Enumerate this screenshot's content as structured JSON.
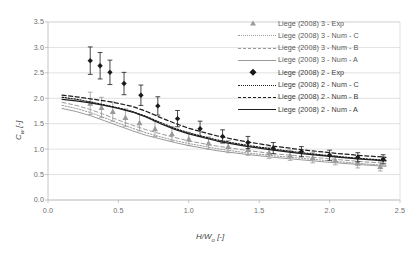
{
  "chart_data": {
    "type": "scatter",
    "title": "",
    "xlabel": "H/W_o [-]",
    "xlabel_display": "H/W",
    "xlabel_sub": "o",
    "xlabel_unit": " [-]",
    "ylabel": "C_w [-]",
    "ylabel_display": "C",
    "ylabel_sub": "w",
    "ylabel_unit": " [-]",
    "xlim": [
      0.0,
      2.5
    ],
    "ylim": [
      0.0,
      3.5
    ],
    "xticks": [
      "0.0",
      "0.5",
      "1.0",
      "1.5",
      "2.0",
      "2.5"
    ],
    "xtick_values": [
      0.0,
      0.5,
      1.0,
      1.5,
      2.0,
      2.5
    ],
    "yticks": [
      "0.0",
      "0.5",
      "1.0",
      "1.5",
      "2.0",
      "2.5",
      "3.0",
      "3.5"
    ],
    "ytick_values": [
      0.0,
      0.5,
      1.0,
      1.5,
      2.0,
      2.5,
      3.0,
      3.5
    ],
    "grid": "horizontal",
    "legend_position": "right",
    "series": [
      {
        "name": "Liege (2008) 3 - Exp",
        "type": "scatter",
        "marker": "triangle",
        "color": "#9a9a9a",
        "has_error_bars": true,
        "x": [
          0.3,
          0.38,
          0.46,
          0.55,
          0.65,
          0.76,
          0.88,
          1.0,
          1.14,
          1.28,
          1.42,
          1.57,
          1.72,
          1.88,
          2.04,
          2.2,
          2.36
        ],
        "y": [
          1.9,
          1.82,
          1.74,
          1.62,
          1.52,
          1.4,
          1.3,
          1.2,
          1.12,
          1.05,
          0.99,
          0.93,
          0.88,
          0.83,
          0.78,
          0.72,
          0.66
        ],
        "yerr": [
          0.22,
          0.2,
          0.19,
          0.17,
          0.16,
          0.15,
          0.14,
          0.13,
          0.12,
          0.12,
          0.11,
          0.11,
          0.1,
          0.1,
          0.09,
          0.09,
          0.09
        ]
      },
      {
        "name": "Liege (2008) 3 - Num - C",
        "type": "line",
        "style": "dotted",
        "color": "#9a9a9a",
        "x": [
          0.1,
          0.2,
          0.3,
          0.4,
          0.5,
          0.6,
          0.7,
          0.8,
          0.9,
          1.0,
          1.2,
          1.4,
          1.6,
          1.8,
          2.0,
          2.2,
          2.4
        ],
        "y": [
          1.86,
          1.8,
          1.72,
          1.62,
          1.51,
          1.41,
          1.32,
          1.24,
          1.17,
          1.11,
          1.01,
          0.93,
          0.87,
          0.82,
          0.77,
          0.72,
          0.68
        ]
      },
      {
        "name": "Liege (2008) 3 - Num - B",
        "type": "line",
        "style": "dashed",
        "color": "#9a9a9a",
        "x": [
          0.1,
          0.2,
          0.3,
          0.4,
          0.5,
          0.6,
          0.7,
          0.8,
          0.9,
          1.0,
          1.2,
          1.4,
          1.6,
          1.8,
          2.0,
          2.2,
          2.4
        ],
        "y": [
          1.92,
          1.86,
          1.78,
          1.68,
          1.57,
          1.47,
          1.38,
          1.3,
          1.23,
          1.16,
          1.06,
          0.98,
          0.91,
          0.86,
          0.81,
          0.76,
          0.72
        ]
      },
      {
        "name": "Liege (2008) 3 - Num - A",
        "type": "line",
        "style": "solid",
        "color": "#9a9a9a",
        "x": [
          0.1,
          0.2,
          0.3,
          0.4,
          0.5,
          0.6,
          0.7,
          0.8,
          0.9,
          1.0,
          1.2,
          1.4,
          1.6,
          1.8,
          2.0,
          2.2,
          2.4
        ],
        "y": [
          1.8,
          1.74,
          1.66,
          1.56,
          1.46,
          1.36,
          1.27,
          1.2,
          1.13,
          1.07,
          0.97,
          0.9,
          0.84,
          0.79,
          0.74,
          0.7,
          0.66
        ]
      },
      {
        "name": "Liege (2008) 2 - Exp",
        "type": "scatter",
        "marker": "diamond",
        "color": "#1a1a1a",
        "has_error_bars": true,
        "x": [
          0.3,
          0.37,
          0.44,
          0.54,
          0.66,
          0.78,
          0.92,
          1.08,
          1.24,
          1.42,
          1.6,
          1.8,
          2.0,
          2.2,
          2.38
        ],
        "y": [
          2.74,
          2.64,
          2.51,
          2.29,
          2.06,
          1.85,
          1.6,
          1.4,
          1.25,
          1.13,
          1.02,
          0.95,
          0.88,
          0.84,
          0.8
        ],
        "yerr": [
          0.27,
          0.26,
          0.24,
          0.22,
          0.2,
          0.18,
          0.16,
          0.15,
          0.13,
          0.12,
          0.11,
          0.1,
          0.1,
          0.09,
          0.09
        ]
      },
      {
        "name": "Liege (2008) 2 - Num - C",
        "type": "line",
        "style": "dotted",
        "color": "#1f1f1f",
        "x": [
          0.1,
          0.2,
          0.3,
          0.4,
          0.5,
          0.6,
          0.7,
          0.8,
          0.9,
          1.0,
          1.2,
          1.4,
          1.6,
          1.8,
          2.0,
          2.2,
          2.4
        ],
        "y": [
          2.02,
          1.98,
          1.93,
          1.87,
          1.81,
          1.74,
          1.64,
          1.52,
          1.41,
          1.32,
          1.18,
          1.08,
          1.0,
          0.93,
          0.87,
          0.82,
          0.78
        ]
      },
      {
        "name": "Liege (2008) 2 - Num - B",
        "type": "line",
        "style": "dashed",
        "color": "#1f1f1f",
        "x": [
          0.1,
          0.2,
          0.3,
          0.4,
          0.5,
          0.6,
          0.7,
          0.8,
          0.9,
          1.0,
          1.2,
          1.4,
          1.6,
          1.8,
          2.0,
          2.2,
          2.4
        ],
        "y": [
          2.06,
          2.03,
          1.99,
          1.95,
          1.9,
          1.84,
          1.74,
          1.62,
          1.51,
          1.41,
          1.26,
          1.15,
          1.06,
          0.99,
          0.93,
          0.88,
          0.84
        ]
      },
      {
        "name": "Liege (2008) 2 - Num - A",
        "type": "line",
        "style": "solid",
        "color": "#1f1f1f",
        "x": [
          0.1,
          0.2,
          0.3,
          0.4,
          0.5,
          0.6,
          0.7,
          0.8,
          0.9,
          1.0,
          1.2,
          1.4,
          1.6,
          1.8,
          2.0,
          2.2,
          2.4
        ],
        "y": [
          1.98,
          1.95,
          1.91,
          1.86,
          1.8,
          1.73,
          1.63,
          1.5,
          1.39,
          1.3,
          1.16,
          1.06,
          0.98,
          0.91,
          0.86,
          0.81,
          0.77
        ]
      }
    ]
  },
  "legend": {
    "items": [
      {
        "label": "Liege (2008) 3 - Exp",
        "key": "triangle",
        "color": "gray"
      },
      {
        "label": "Liege (2008) 3 - Num - C",
        "key": "dotted",
        "color": "gray"
      },
      {
        "label": "Liege (2008) 3 - Num - B",
        "key": "dashed",
        "color": "gray"
      },
      {
        "label": "Liege (2008) 3 - Num - A",
        "key": "solid",
        "color": "gray"
      },
      {
        "label": "Liege (2008) 2 - Exp",
        "key": "diamond",
        "color": "black"
      },
      {
        "label": "Liege (2008) 2 - Num - C",
        "key": "dotted",
        "color": "black"
      },
      {
        "label": "Liege (2008) 2 - Num - B",
        "key": "dashed",
        "color": "black"
      },
      {
        "label": "Liege (2008) 2 - Num - A",
        "key": "solid",
        "color": "black"
      }
    ]
  },
  "colors": {
    "gray_series": "#9a9a9a",
    "black_series": "#1a1a1a",
    "grid": "#d9d9d9",
    "axis": "#bfbfbf",
    "tick_text": "#6d6d6d"
  }
}
